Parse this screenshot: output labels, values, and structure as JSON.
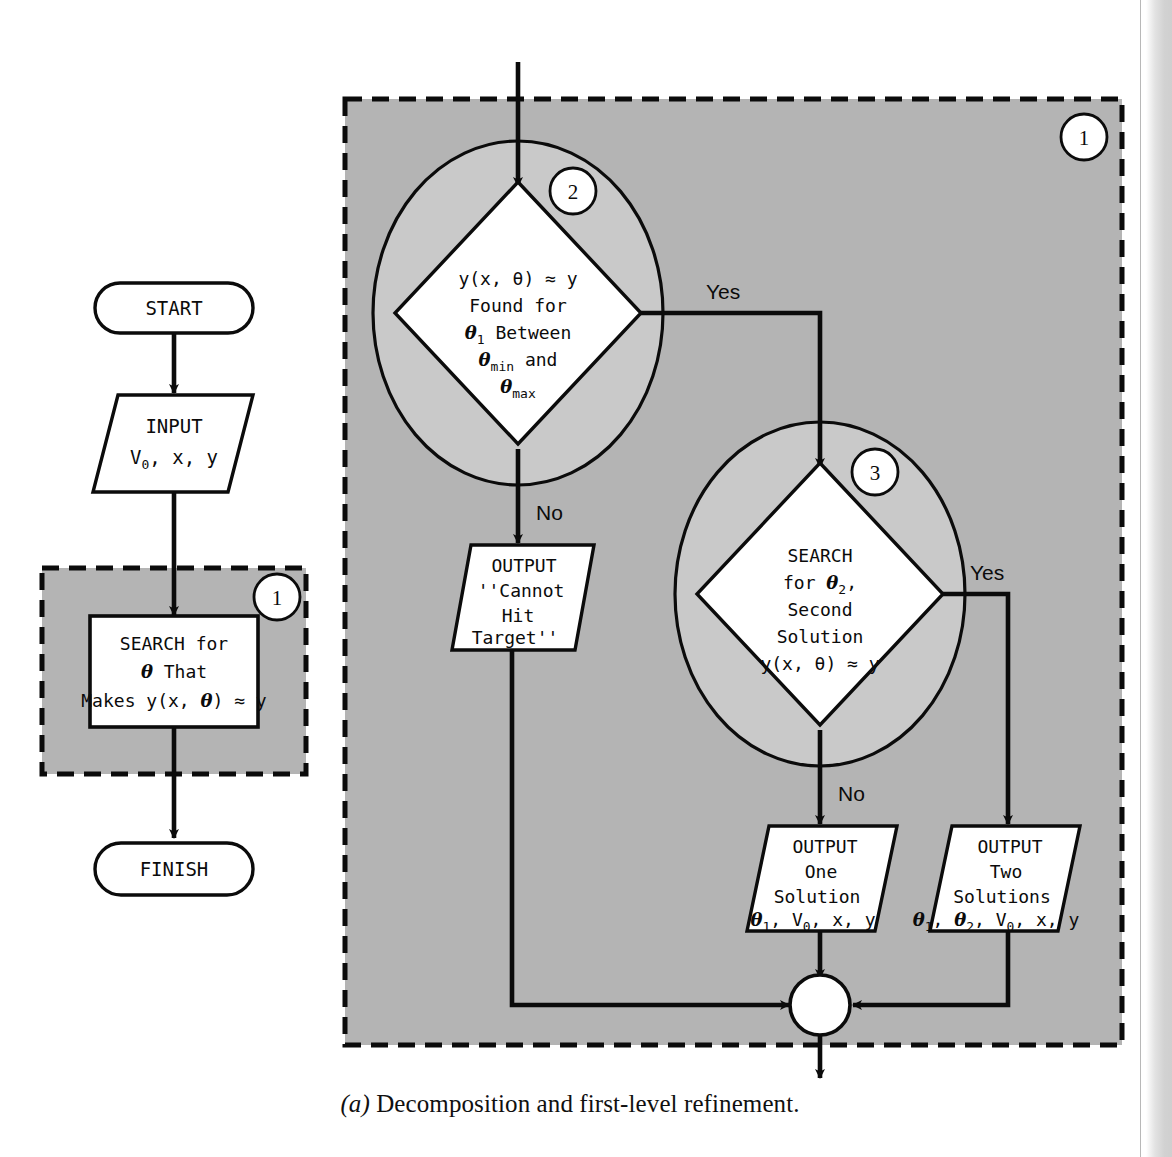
{
  "figure": {
    "caption_marker": "(a)",
    "caption_text": " Decomposition and first-level refinement."
  },
  "colors": {
    "shade_gray": "#b4b4b4",
    "shade_gray_light": "#c9c9c9",
    "stroke": "#0b0b0b",
    "fill_white": "#ffffff"
  },
  "left_column": {
    "start_terminal": "START",
    "input_box": {
      "line1": "INPUT",
      "line2_a": "V",
      "line2_sub": "0",
      "line2_b": ", x, y"
    },
    "module_badge": "1",
    "search_box": {
      "line1": "SEARCH for",
      "line2_theta": "θ",
      "line2_rest": " That",
      "line3_a": "Makes y(x, ",
      "line3_theta": "θ",
      "line3_b": ") ≈ y"
    },
    "finish_terminal": "FINISH"
  },
  "refinement": {
    "module_badge": "1",
    "decision_2": {
      "badge": "2",
      "line1": "y(x, θ) ≈ y",
      "line2": "Found for",
      "line3_theta": "θ",
      "line3_sub": "1",
      "line3_rest": " Between",
      "line4_theta": "θ",
      "line4_sub": "min",
      "line4_rest": " and",
      "line5_theta": "θ",
      "line5_sub": "max",
      "yes_label": "Yes",
      "no_label": "No"
    },
    "decision_3": {
      "badge": "3",
      "line1": "SEARCH",
      "line2_a": "for ",
      "line2_theta": "θ",
      "line2_sub": "2",
      "line2_b": ",",
      "line3": "Second",
      "line4": "Solution",
      "line5": "y(x, θ) ≈ y",
      "yes_label": "Yes",
      "no_label": "No"
    },
    "output_cannot_hit": {
      "line1": "OUTPUT",
      "line2": "''Cannot",
      "line3": "Hit",
      "line4": "Target''"
    },
    "output_one_solution": {
      "line1": "OUTPUT",
      "line2": "One",
      "line3": "Solution",
      "line4_theta": "θ",
      "line4_sub": "1",
      "line4_mid": ", V",
      "line4_sub2": "0",
      "line4_rest": ", x, y"
    },
    "output_two_solutions": {
      "line1": "OUTPUT",
      "line2": "Two",
      "line3": "Solutions",
      "line4_theta1": "θ",
      "line4_sub1": "1",
      "line4_c1": ", ",
      "line4_theta2": "θ",
      "line4_sub2": "2",
      "line4_mid": ", V",
      "line4_sub3": "0",
      "line4_rest": ", x, y"
    }
  }
}
